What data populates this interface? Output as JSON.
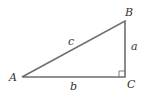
{
  "diagram": {
    "type": "right-triangle",
    "vertices": [
      {
        "id": "A",
        "label": "A",
        "x": 22,
        "y": 77
      },
      {
        "id": "B",
        "label": "B",
        "x": 125,
        "y": 21
      },
      {
        "id": "C",
        "label": "C",
        "x": 125,
        "y": 77
      }
    ],
    "sides": [
      {
        "id": "a",
        "label": "a",
        "from": "B",
        "to": "C"
      },
      {
        "id": "b",
        "label": "b",
        "from": "A",
        "to": "C"
      },
      {
        "id": "c",
        "label": "c",
        "from": "A",
        "to": "B"
      }
    ],
    "right_angle_at": "C",
    "line_color": "#6e6e6e",
    "text_color": "#333333"
  }
}
